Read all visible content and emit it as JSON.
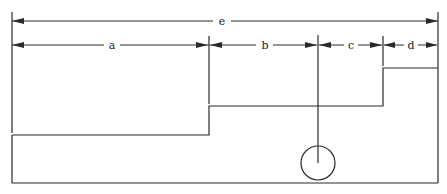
{
  "diagram": {
    "type": "dimensioned cross-section profile",
    "colors": {
      "line": "#2a2a2a",
      "background": "#ffffff"
    },
    "dimensions": {
      "overall": {
        "label": "e",
        "from_x": 12,
        "to_x": 438,
        "y": 21
      },
      "segments": [
        {
          "label": "a",
          "from_x": 12,
          "to_x": 209
        },
        {
          "label": "b",
          "from_x": 209,
          "to_x": 318
        },
        {
          "label": "c",
          "from_x": 318,
          "to_x": 383
        },
        {
          "label": "d",
          "from_x": 383,
          "to_x": 438
        }
      ],
      "segment_row_y": 45
    },
    "profile": {
      "left_x": 12,
      "right_x": 438,
      "bottom_y": 183,
      "steps": [
        {
          "x_start": 12,
          "x_end": 209,
          "top_y": 135
        },
        {
          "x_start": 209,
          "x_end": 383,
          "top_y": 106
        },
        {
          "x_start": 383,
          "x_end": 438,
          "top_y": 68
        }
      ]
    },
    "marker": {
      "shape": "circle",
      "cx": 318,
      "cy": 163,
      "r": 17,
      "stem_top_y": 35
    }
  }
}
